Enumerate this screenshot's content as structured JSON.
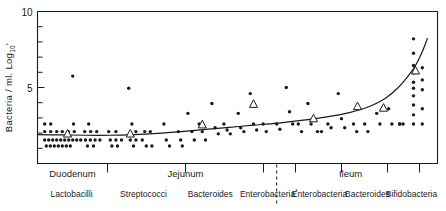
{
  "chart_data": {
    "type": "scatter",
    "title": "",
    "subtitle": "",
    "ylabel": "Bacteria / ml. Log",
    "ylabel_subscript": "10",
    "xlabel": "",
    "ylim": [
      0,
      10
    ],
    "yticks": [
      10,
      5
    ],
    "ytick_labels": [
      "10",
      "5"
    ],
    "ytick_minor_count": 9,
    "grid": false,
    "legend_position": "none",
    "x_regions": [
      {
        "name": "Duodenum",
        "start": 0.0,
        "end": 0.175
      },
      {
        "name": "Jejunum",
        "start": 0.175,
        "end": 0.565
      },
      {
        "name": "Ileum",
        "start": 0.565,
        "end": 1.0
      }
    ],
    "x_groups": [
      {
        "label": "Lactobacilli",
        "mark": "",
        "center": 0.085
      },
      {
        "label": "Streptococci",
        "mark": "",
        "center": 0.265
      },
      {
        "label": "Bacteroides",
        "mark": "",
        "center": 0.432
      },
      {
        "label": "Enterobacteria",
        "mark": "*",
        "center": 0.578
      },
      {
        "label": "Enterobacteria",
        "mark": "",
        "center": 0.705
      },
      {
        "label": "Bacteroides",
        "mark": "",
        "center": 0.825
      },
      {
        "label": "Bifidobacteria",
        "mark": "",
        "center": 0.935
      }
    ],
    "x_tick_positions": [
      0.175,
      0.37,
      0.565,
      0.645,
      0.76,
      0.875,
      0.955
    ],
    "dashed_separator_x": 0.598,
    "series": [
      {
        "name": "individual-samples",
        "marker": "filled-circle",
        "points": [
          [
            0.018,
            2.6
          ],
          [
            0.033,
            2.6
          ],
          [
            0.018,
            2.1
          ],
          [
            0.033,
            2.1
          ],
          [
            0.048,
            2.1
          ],
          [
            0.062,
            2.1
          ],
          [
            0.077,
            2.1
          ],
          [
            0.092,
            2.1
          ],
          [
            0.018,
            1.55
          ],
          [
            0.028,
            1.55
          ],
          [
            0.038,
            1.55
          ],
          [
            0.048,
            1.55
          ],
          [
            0.058,
            1.55
          ],
          [
            0.068,
            1.55
          ],
          [
            0.078,
            1.55
          ],
          [
            0.088,
            1.55
          ],
          [
            0.098,
            1.55
          ],
          [
            0.108,
            1.55
          ],
          [
            0.022,
            1.15
          ],
          [
            0.032,
            1.15
          ],
          [
            0.042,
            1.15
          ],
          [
            0.052,
            1.15
          ],
          [
            0.062,
            1.15
          ],
          [
            0.072,
            1.15
          ],
          [
            0.082,
            1.15
          ],
          [
            0.088,
            5.75
          ],
          [
            0.09,
            2.6
          ],
          [
            0.128,
            2.6
          ],
          [
            0.118,
            2.1
          ],
          [
            0.133,
            2.1
          ],
          [
            0.148,
            2.1
          ],
          [
            0.12,
            1.55
          ],
          [
            0.132,
            1.55
          ],
          [
            0.144,
            1.55
          ],
          [
            0.156,
            1.55
          ],
          [
            0.125,
            1.15
          ],
          [
            0.14,
            1.15
          ],
          [
            0.178,
            2.1
          ],
          [
            0.196,
            2.1
          ],
          [
            0.182,
            1.55
          ],
          [
            0.196,
            1.55
          ],
          [
            0.21,
            1.55
          ],
          [
            0.186,
            1.15
          ],
          [
            0.2,
            1.15
          ],
          [
            0.228,
            4.95
          ],
          [
            0.236,
            2.6
          ],
          [
            0.246,
            2.1
          ],
          [
            0.232,
            1.55
          ],
          [
            0.246,
            1.55
          ],
          [
            0.24,
            1.15
          ],
          [
            0.268,
            2.1
          ],
          [
            0.282,
            2.1
          ],
          [
            0.262,
            1.55
          ],
          [
            0.272,
            1.15
          ],
          [
            0.286,
            1.15
          ],
          [
            0.316,
            2.6
          ],
          [
            0.322,
            1.55
          ],
          [
            0.33,
            1.15
          ],
          [
            0.352,
            2.1
          ],
          [
            0.358,
            1.55
          ],
          [
            0.362,
            1.15
          ],
          [
            0.376,
            3.3
          ],
          [
            0.386,
            2.1
          ],
          [
            0.392,
            1.55
          ],
          [
            0.404,
            2.6
          ],
          [
            0.412,
            2.1
          ],
          [
            0.42,
            1.55
          ],
          [
            0.436,
            3.95
          ],
          [
            0.444,
            2.35
          ],
          [
            0.452,
            1.95
          ],
          [
            0.466,
            2.6
          ],
          [
            0.474,
            2.2
          ],
          [
            0.482,
            1.95
          ],
          [
            0.502,
            3.3
          ],
          [
            0.508,
            2.35
          ],
          [
            0.516,
            2.1
          ],
          [
            0.532,
            4.6
          ],
          [
            0.54,
            2.6
          ],
          [
            0.548,
            2.2
          ],
          [
            0.564,
            2.6
          ],
          [
            0.572,
            2.1
          ],
          [
            0.598,
            2.6
          ],
          [
            0.606,
            2.25
          ],
          [
            0.622,
            5.0
          ],
          [
            0.63,
            3.4
          ],
          [
            0.638,
            2.6
          ],
          [
            0.652,
            2.6
          ],
          [
            0.66,
            2.1
          ],
          [
            0.676,
            3.95
          ],
          [
            0.684,
            2.6
          ],
          [
            0.7,
            2.1
          ],
          [
            0.71,
            2.1
          ],
          [
            0.726,
            2.6
          ],
          [
            0.734,
            2.35
          ],
          [
            0.752,
            4.6
          ],
          [
            0.76,
            2.95
          ],
          [
            0.768,
            2.35
          ],
          [
            0.79,
            2.6
          ],
          [
            0.798,
            2.1
          ],
          [
            0.818,
            2.6
          ],
          [
            0.826,
            2.1
          ],
          [
            0.848,
            3.3
          ],
          [
            0.856,
            2.6
          ],
          [
            0.878,
            3.6
          ],
          [
            0.886,
            2.6
          ],
          [
            0.906,
            2.6
          ],
          [
            0.914,
            2.6
          ],
          [
            0.94,
            8.2
          ],
          [
            0.94,
            7.25
          ],
          [
            0.94,
            6.45
          ],
          [
            0.94,
            5.95
          ],
          [
            0.94,
            5.35
          ],
          [
            0.94,
            4.95
          ],
          [
            0.94,
            4.45
          ],
          [
            0.94,
            3.85
          ],
          [
            0.94,
            3.2
          ],
          [
            0.94,
            2.6
          ],
          [
            0.962,
            6.3
          ],
          [
            0.962,
            5.5
          ],
          [
            0.962,
            4.85
          ],
          [
            0.962,
            3.6
          ],
          [
            0.962,
            2.6
          ],
          [
            0.905,
            2.6
          ]
        ]
      },
      {
        "name": "median-values",
        "marker": "open-triangle",
        "points": [
          [
            0.075,
            1.95
          ],
          [
            0.232,
            1.95
          ],
          [
            0.412,
            2.55
          ],
          [
            0.54,
            3.9
          ],
          [
            0.69,
            2.95
          ],
          [
            0.8,
            3.75
          ],
          [
            0.865,
            3.65
          ],
          [
            0.945,
            6.1
          ]
        ]
      }
    ],
    "trend_line": {
      "name": "fitted-trend",
      "points": [
        [
          0.0,
          1.9
        ],
        [
          0.06,
          1.88
        ],
        [
          0.12,
          1.86
        ],
        [
          0.18,
          1.86
        ],
        [
          0.24,
          1.9
        ],
        [
          0.3,
          1.98
        ],
        [
          0.36,
          2.1
        ],
        [
          0.42,
          2.24
        ],
        [
          0.48,
          2.38
        ],
        [
          0.54,
          2.52
        ],
        [
          0.6,
          2.66
        ],
        [
          0.66,
          2.84
        ],
        [
          0.72,
          3.05
        ],
        [
          0.78,
          3.35
        ],
        [
          0.83,
          3.75
        ],
        [
          0.87,
          4.3
        ],
        [
          0.9,
          4.95
        ],
        [
          0.925,
          5.7
        ],
        [
          0.945,
          6.45
        ],
        [
          0.962,
          7.35
        ],
        [
          0.975,
          8.25
        ]
      ]
    },
    "footnote": ""
  },
  "axis": {
    "y_top_label": "10",
    "y_mid_label": "5",
    "y_title_main": "Bacteria / ml. Log",
    "y_title_sub": "10"
  },
  "regions": {
    "duodenum": "Duodenum",
    "jejunum": "Jejunum",
    "ileum": "Ileum"
  },
  "groups": {
    "g1": "Lactobacilli",
    "g2": "Streptococci",
    "g3": "Bacteroides",
    "g4": "Enterobacteria",
    "g4_mark": "*",
    "g5": "Enterobacteria",
    "g6": "Bacteroides",
    "g7": "Bifidobacteria"
  },
  "colors": {
    "ink": "#1a1a1a",
    "background": "#ffffff",
    "marker_fill": "#1a1a1a",
    "median_fill": "#ffffff"
  }
}
